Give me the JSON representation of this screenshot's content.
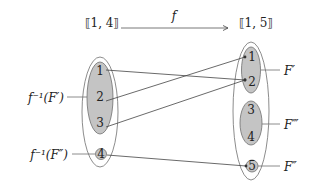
{
  "diagram": {
    "type": "function-mapping",
    "function_name": "f",
    "domain_set": {
      "label": "⟦1, 4⟧",
      "elements": [
        "1",
        "2",
        "3",
        "4"
      ]
    },
    "codomain_set": {
      "label": "⟦1, 5⟧",
      "elements": [
        "1",
        "2",
        "3",
        "4",
        "5"
      ]
    },
    "mappings": [
      {
        "from": "1",
        "to": "2"
      },
      {
        "from": "2",
        "to": "1"
      },
      {
        "from": "3",
        "to": "2"
      },
      {
        "from": "4",
        "to": "5"
      }
    ],
    "subsets": {
      "domain": [
        {
          "label": "f⁻¹(F′)",
          "members": [
            "1",
            "2",
            "3"
          ]
        },
        {
          "label": "f⁻¹(F″)",
          "members": [
            "4"
          ]
        }
      ],
      "codomain": [
        {
          "label": "F′",
          "members": [
            "1",
            "2"
          ]
        },
        {
          "label": "F‴",
          "members": [
            "3",
            "4"
          ]
        },
        {
          "label": "F″",
          "members": [
            "5"
          ]
        }
      ]
    },
    "colors": {
      "fill": "#c4c4c4",
      "stroke": "#6e6e6e",
      "text": "#222222"
    }
  }
}
